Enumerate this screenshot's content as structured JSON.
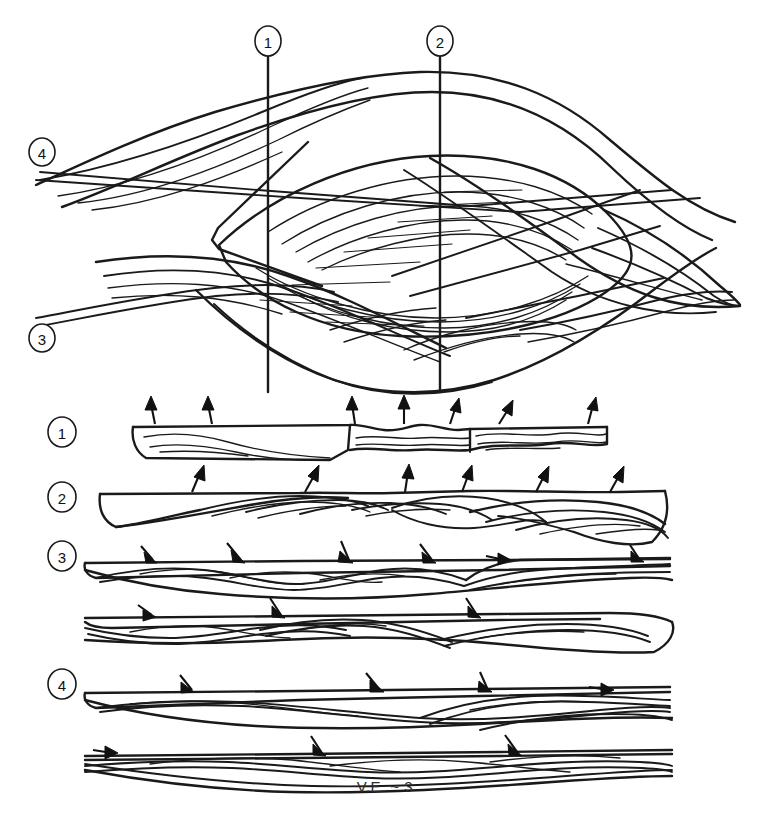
{
  "figure": {
    "type": "geological-cross-section-diagram",
    "title": "",
    "caption": "V.E. ~ 3",
    "caption_position": {
      "x": 385,
      "y": 792
    },
    "background_color": "#ffffff",
    "line_color": "#1a1a1a",
    "arrow_color": "#111111"
  },
  "section_markers_top": [
    {
      "label": "1",
      "cx": 268,
      "cy": 41,
      "line_x": 268,
      "line_y1": 55,
      "line_y2": 392
    },
    {
      "label": "2",
      "cx": 440,
      "cy": 41,
      "line_x": 440,
      "line_y1": 55,
      "line_y2": 392
    }
  ],
  "section_markers_left": [
    {
      "label": "4",
      "cx": 42,
      "cy": 152
    },
    {
      "label": "3",
      "cx": 42,
      "cy": 338
    }
  ],
  "strip_labels": [
    {
      "label": "1",
      "cx": 62,
      "cy": 432
    },
    {
      "label": "2",
      "cx": 62,
      "cy": 497
    },
    {
      "label": "3",
      "cx": 62,
      "cy": 556
    },
    {
      "label": "4",
      "cx": 62,
      "cy": 684
    }
  ],
  "strips": [
    {
      "name": "section-1",
      "label": "1",
      "top_y": 425,
      "x_start": 133,
      "x_end": 607,
      "arrow_count": 7,
      "arrow_direction": "up",
      "arrows": [
        {
          "x": 155,
          "y": 424,
          "dx": -4,
          "dy": -26
        },
        {
          "x": 212,
          "y": 424,
          "dx": -4,
          "dy": -26
        },
        {
          "x": 355,
          "y": 424,
          "dx": -3,
          "dy": -26
        },
        {
          "x": 404,
          "y": 424,
          "dx": 0,
          "dy": -27
        },
        {
          "x": 450,
          "y": 424,
          "dx": 6,
          "dy": -25
        },
        {
          "x": 499,
          "y": 424,
          "dx": 10,
          "dy": -24
        },
        {
          "x": 588,
          "y": 424,
          "dx": 5,
          "dy": -25
        }
      ]
    },
    {
      "name": "section-2",
      "label": "2",
      "top_y": 494,
      "x_start": 100,
      "x_end": 665,
      "arrow_count": 6,
      "arrow_direction": "up",
      "arrows": [
        {
          "x": 192,
          "y": 492,
          "dx": 8,
          "dy": -26
        },
        {
          "x": 305,
          "y": 492,
          "dx": 10,
          "dy": -26
        },
        {
          "x": 405,
          "y": 492,
          "dx": 3,
          "dy": -27
        },
        {
          "x": 462,
          "y": 492,
          "dx": 7,
          "dy": -26
        },
        {
          "x": 536,
          "y": 492,
          "dx": 9,
          "dy": -26
        },
        {
          "x": 610,
          "y": 492,
          "dx": 10,
          "dy": -25
        }
      ]
    },
    {
      "name": "section-3",
      "label": "3",
      "top_y": 562,
      "x_start": 85,
      "x_end": 670,
      "arrow_count": 6,
      "arrow_direction": "down-right",
      "arrows": [
        {
          "x": 153,
          "y": 560,
          "dx": -14,
          "dy": -16
        },
        {
          "x": 241,
          "y": 560,
          "dx": -16,
          "dy": -18
        },
        {
          "x": 349,
          "y": 560,
          "dx": -9,
          "dy": -20
        },
        {
          "x": 432,
          "y": 560,
          "dx": -13,
          "dy": -17
        },
        {
          "x": 505,
          "y": 560,
          "dx": -20,
          "dy": -5
        },
        {
          "x": 640,
          "y": 560,
          "dx": -11,
          "dy": -16
        }
      ]
    },
    {
      "name": "section-unlabeled-a",
      "label": "",
      "top_y": 617,
      "x_start": 85,
      "x_end": 672,
      "arrow_count": 3,
      "arrow_direction": "down-right",
      "arrows": [
        {
          "x": 152,
          "y": 615,
          "dx": -16,
          "dy": -12
        },
        {
          "x": 281,
          "y": 615,
          "dx": -11,
          "dy": -19
        },
        {
          "x": 477,
          "y": 615,
          "dx": -11,
          "dy": -19
        }
      ]
    },
    {
      "name": "section-4",
      "label": "4",
      "top_y": 692,
      "x_start": 85,
      "x_end": 670,
      "arrow_count": 4,
      "arrow_direction": "up-right",
      "arrows": [
        {
          "x": 192,
          "y": 690,
          "dx": -14,
          "dy": -17
        },
        {
          "x": 380,
          "y": 690,
          "dx": -16,
          "dy": -19
        },
        {
          "x": 488,
          "y": 690,
          "dx": -9,
          "dy": -20
        },
        {
          "x": 608,
          "y": 690,
          "dx": -18,
          "dy": -6
        }
      ]
    },
    {
      "name": "section-unlabeled-b",
      "label": "",
      "top_y": 755,
      "x_start": 85,
      "x_end": 672,
      "arrow_count": 3,
      "arrow_direction": "down-right",
      "arrows": [
        {
          "x": 112,
          "y": 753,
          "dx": -19,
          "dy": -6
        },
        {
          "x": 322,
          "y": 753,
          "dx": -11,
          "dy": -19
        },
        {
          "x": 518,
          "y": 753,
          "dx": -13,
          "dy": -18
        }
      ]
    }
  ],
  "main_block": {
    "name": "fold-interference-block",
    "x_range": [
      35,
      740
    ],
    "y_range": [
      58,
      392
    ],
    "description": "nested antiform-synform fold traces with central eye/lens structure"
  }
}
